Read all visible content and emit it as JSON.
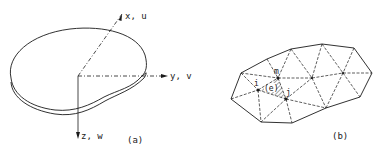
{
  "figure_a": {
    "caption": "(a)",
    "axes": {
      "x": "x, u",
      "y": "y, v",
      "z": "z, w"
    },
    "description": "Thin plate body with reference axes"
  },
  "figure_b": {
    "caption": "(b)",
    "node_labels": {
      "m": "m",
      "i": "i",
      "j": "j"
    },
    "element_label": "(e)",
    "description": "Triangular finite element mesh with highlighted element e (nodes i, j, m)"
  },
  "colors": {
    "ink": "#1a1a1a",
    "background": "#ffffff"
  }
}
